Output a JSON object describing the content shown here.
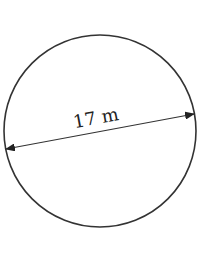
{
  "diagram": {
    "shape": "circle",
    "measurement": "diameter",
    "label": "17 m",
    "value": 17,
    "unit": "m",
    "colors": {
      "stroke": "#333333",
      "background": "#ffffff",
      "text": "#222222"
    }
  }
}
